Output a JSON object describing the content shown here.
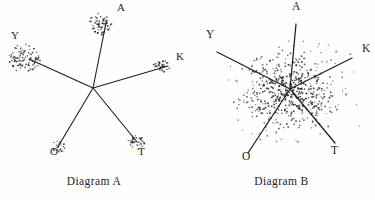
{
  "figure": {
    "background_color": "#fefefe",
    "ink_color": "#1f1f1f",
    "width": 375,
    "height": 200
  },
  "diagrams": [
    {
      "id": "diagram-a",
      "caption": "Diagram A",
      "center": {
        "x": 93,
        "y": 88
      },
      "scatter_style": "clustered",
      "rays": [
        {
          "label": "A",
          "label_x": 117,
          "label_y": 11,
          "end_x": 106,
          "end_y": 23,
          "cluster_x": 101,
          "cluster_y": 24,
          "cluster_rx": 12,
          "cluster_ry": 11,
          "points": 64
        },
        {
          "label": "Y",
          "label_x": 11,
          "label_y": 39,
          "end_x": 29,
          "end_y": 59,
          "cluster_x": 24,
          "cluster_y": 58,
          "cluster_rx": 17,
          "cluster_ry": 14,
          "points": 96
        },
        {
          "label": "K",
          "label_x": 176,
          "label_y": 60,
          "end_x": 168,
          "end_y": 66,
          "cluster_x": 162,
          "cluster_y": 66,
          "cluster_rx": 9,
          "cluster_ry": 6,
          "points": 34
        },
        {
          "label": "O",
          "label_x": 50,
          "label_y": 155,
          "end_x": 59,
          "end_y": 145,
          "cluster_x": 58,
          "cluster_y": 147,
          "cluster_rx": 7,
          "cluster_ry": 6,
          "points": 22
        },
        {
          "label": "T",
          "label_x": 138,
          "label_y": 155,
          "end_x": 137,
          "end_y": 142,
          "cluster_x": 136,
          "cluster_y": 143,
          "cluster_rx": 9,
          "cluster_ry": 8,
          "points": 34
        }
      ]
    },
    {
      "id": "diagram-b",
      "caption": "Diagram B",
      "center": {
        "x": 290,
        "y": 89
      },
      "scatter_style": "diffuse",
      "cloud": {
        "cx": 290,
        "cy": 92,
        "rx": 86,
        "ry": 74,
        "points": 540
      },
      "rays": [
        {
          "label": "A",
          "label_x": 292,
          "label_y": 10,
          "end_x": 296,
          "end_y": 24
        },
        {
          "label": "Y",
          "label_x": 206,
          "label_y": 38,
          "end_x": 217,
          "end_y": 52
        },
        {
          "label": "K",
          "label_x": 362,
          "label_y": 52,
          "end_x": 352,
          "end_y": 58
        },
        {
          "label": "O",
          "label_x": 242,
          "label_y": 160,
          "end_x": 248,
          "end_y": 153
        },
        {
          "label": "T",
          "label_x": 331,
          "label_y": 154,
          "end_x": 335,
          "end_y": 143
        }
      ]
    }
  ]
}
